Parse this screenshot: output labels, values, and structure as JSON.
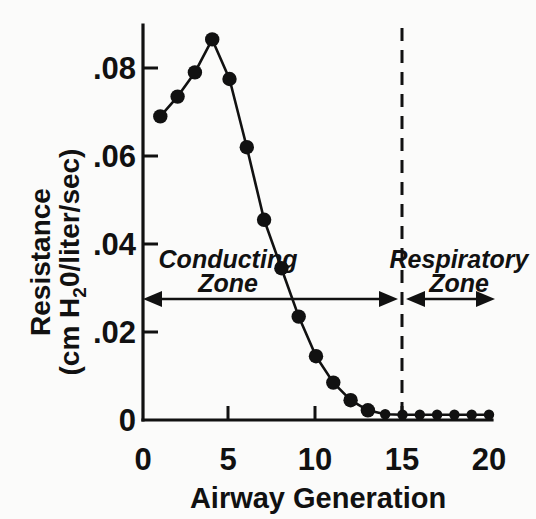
{
  "figure": {
    "background_color": "#fbfbfa",
    "ink_color": "#111111"
  },
  "axis": {
    "x_title": "Airway Generation",
    "y_title_line1": "Resistance",
    "y_title_line2_pre": "(cm H",
    "y_title_line2_sub": "2",
    "y_title_line2_post": "0/liter/sec)",
    "x_ticks": [
      "0",
      "5",
      "10",
      "15",
      "20"
    ],
    "y_ticks": [
      "0",
      ".02",
      ".04",
      ".06",
      ".08"
    ]
  },
  "annotations": {
    "conducting_zone_line1": "Conducting",
    "conducting_zone_line2": "Zone",
    "respiratory_zone_line1": "Respiratory",
    "respiratory_zone_line2": "Zone",
    "divider_generation": "15"
  },
  "chart_data": {
    "type": "line",
    "title": "",
    "xlabel": "Airway Generation",
    "ylabel": "Resistance (cm H2O/liter/sec)",
    "xlim": [
      0,
      20
    ],
    "ylim": [
      0,
      0.092
    ],
    "xticks": [
      0,
      5,
      10,
      15,
      20
    ],
    "yticks": [
      0,
      0.02,
      0.04,
      0.06,
      0.08
    ],
    "ytick_labels": [
      "0",
      ".02",
      ".04",
      ".06",
      ".08"
    ],
    "grid": false,
    "legend": false,
    "marker": "filled-circle",
    "x": [
      1,
      2,
      3,
      4,
      5,
      6,
      7,
      8,
      9,
      10,
      11,
      12,
      13,
      14,
      15,
      16,
      17,
      18,
      19,
      20
    ],
    "values": [
      0.069,
      0.0735,
      0.079,
      0.0865,
      0.0775,
      0.062,
      0.0455,
      0.0345,
      0.0235,
      0.0145,
      0.0085,
      0.0045,
      0.0022,
      0.0013,
      0.0012,
      0.0012,
      0.0012,
      0.0012,
      0.0012,
      0.0012
    ],
    "annotations": [
      {
        "text": "Conducting Zone",
        "x_range": [
          0,
          15
        ],
        "y": 0.0295,
        "style": "double-arrow"
      },
      {
        "text": "Respiratory Zone",
        "x_range": [
          15,
          20
        ],
        "y": 0.0295,
        "style": "double-arrow"
      },
      {
        "text": "",
        "x": 15,
        "style": "vertical-dashed-divider"
      }
    ]
  }
}
